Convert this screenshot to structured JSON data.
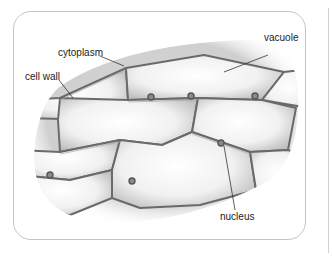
{
  "diagram": {
    "labels": {
      "cytoplasm": "cytoplasm",
      "cell_wall": "cell wall",
      "vacuole": "vacuole",
      "nucleus": "nucleus"
    },
    "colors": {
      "wall": "#6a6a6a",
      "wall_light": "#a8a8a8",
      "cell_fill": "#efefef",
      "nucleus": "#555555",
      "leader": "#333333"
    }
  }
}
